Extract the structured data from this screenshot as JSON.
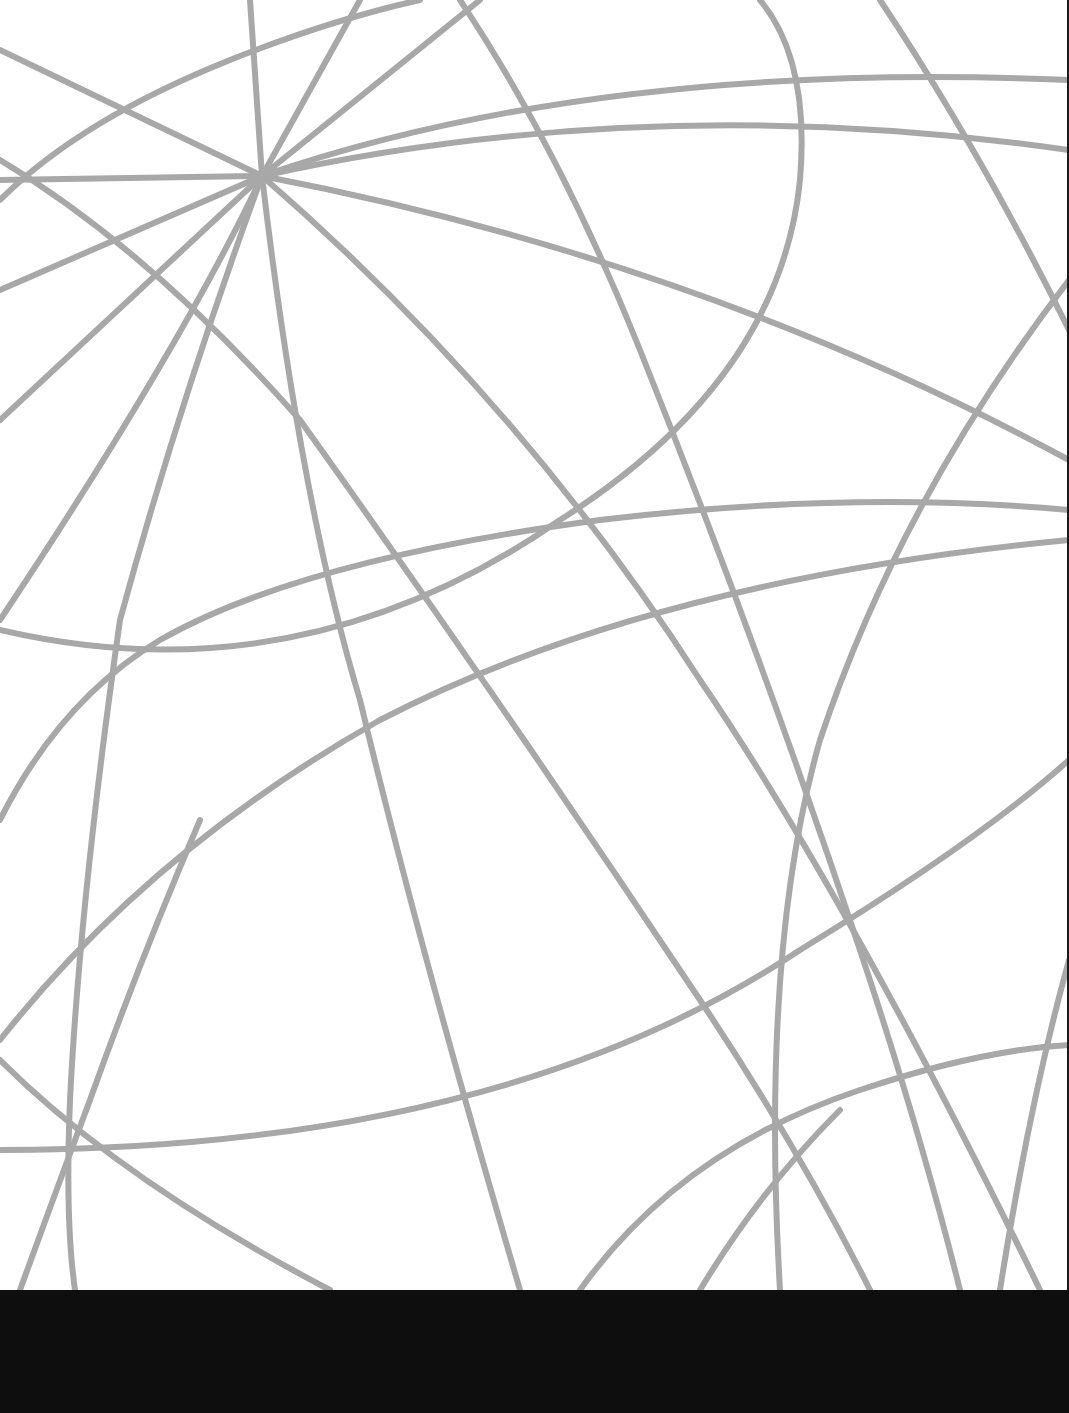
{
  "page": {
    "background": "#ffffff",
    "line_color": "#a8a8a8",
    "band_color": "#0e0e0e"
  },
  "pattern": {
    "description": "Gray geometric line/curve pattern radiating from a focal point",
    "focal_point": [
      262,
      176
    ]
  }
}
